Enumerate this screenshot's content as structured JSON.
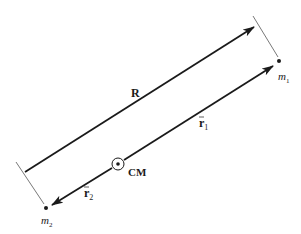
{
  "diagram": {
    "colors": {
      "ink": "#1a1a1a",
      "thin": "#555555",
      "background": "#ffffff"
    },
    "labels": {
      "R": "R",
      "r1": "r",
      "r1_sub": "1",
      "r2": "r",
      "r2_sub": "2",
      "cm": "CM",
      "m1": "m",
      "m1_sub": "1",
      "m2": "m",
      "m2_sub": "2"
    },
    "points": {
      "m1": [
        279,
        61
      ],
      "m2": [
        46,
        208
      ],
      "cm": [
        118,
        164
      ]
    },
    "vectors": [
      {
        "name": "R",
        "from": [
          25,
          172
        ],
        "to": [
          254,
          27
        ]
      },
      {
        "name": "r1",
        "from": [
          124,
          160
        ],
        "to": [
          273,
          66
        ]
      },
      {
        "name": "r2",
        "from": [
          112,
          168
        ],
        "to": [
          52,
          205
        ]
      }
    ]
  }
}
